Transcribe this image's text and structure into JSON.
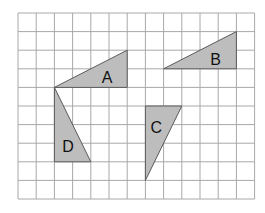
{
  "diagram": {
    "type": "grid-with-triangles",
    "grid": {
      "columns": 13,
      "rows": 10,
      "origin_px": [
        18,
        13
      ],
      "cell_w": 18.2,
      "cell_h": 18.6,
      "line_color": "#a8a8a8",
      "background": "#ffffff"
    },
    "fill_color": "#bdbdbd",
    "stroke_color": "#5a5a5a",
    "shapes": [
      {
        "label": "A",
        "vertices": [
          [
            2,
            4
          ],
          [
            6,
            2
          ],
          [
            6,
            4
          ]
        ],
        "label_pos": [
          4.9,
          3.55
        ]
      },
      {
        "label": "B",
        "vertices": [
          [
            8,
            3
          ],
          [
            12,
            1
          ],
          [
            12,
            3
          ]
        ],
        "label_pos": [
          10.85,
          2.55
        ]
      },
      {
        "label": "C",
        "vertices": [
          [
            7,
            5
          ],
          [
            9,
            5
          ],
          [
            7,
            9
          ]
        ],
        "label_pos": [
          7.6,
          6.25
        ]
      },
      {
        "label": "D",
        "vertices": [
          [
            2,
            4
          ],
          [
            2,
            8
          ],
          [
            4,
            8
          ]
        ],
        "label_pos": [
          2.75,
          7.25
        ]
      }
    ]
  }
}
